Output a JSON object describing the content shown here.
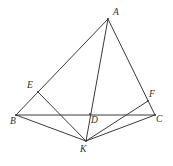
{
  "figure": {
    "type": "geometry-diagram",
    "canvas": {
      "width": 173,
      "height": 166,
      "background": "#ffffff"
    },
    "stroke_color": "#3a3a3a",
    "stroke_width": 1,
    "label_color": "#2e2e2e",
    "points": [
      {
        "id": "A",
        "label": "A",
        "x": 108,
        "y": 19,
        "label_x": 113,
        "label_y": 8,
        "on": "apex of triangle"
      },
      {
        "id": "E",
        "label": "E",
        "x": 38,
        "y": 92,
        "label_x": 27,
        "label_y": 81,
        "on": "segment AB"
      },
      {
        "id": "B",
        "label": "B",
        "x": 16,
        "y": 115,
        "label_x": 10,
        "label_y": 117,
        "on": "left base vertex"
      },
      {
        "id": "D",
        "label": "D",
        "x": 90,
        "y": 114,
        "label_x": 91,
        "label_y": 116,
        "on": "segment BC"
      },
      {
        "id": "K",
        "label": "K",
        "x": 86,
        "y": 141,
        "label_x": 80,
        "label_y": 145,
        "on": "below base BC"
      },
      {
        "id": "F",
        "label": "F",
        "x": 148,
        "y": 101,
        "label_x": 149,
        "label_y": 90,
        "on": "segment AC"
      },
      {
        "id": "C",
        "label": "C",
        "x": 155,
        "y": 115,
        "label_x": 156,
        "label_y": 115,
        "on": "right base vertex"
      }
    ],
    "segments": [
      {
        "name": "AB",
        "from": "A",
        "to": "B",
        "x1": 108,
        "y1": 19,
        "x2": 16,
        "y2": 115
      },
      {
        "name": "AC",
        "from": "A",
        "to": "C",
        "x1": 108,
        "y1": 19,
        "x2": 155,
        "y2": 115
      },
      {
        "name": "BC",
        "from": "B",
        "to": "C",
        "x1": 16,
        "y1": 115,
        "x2": 155,
        "y2": 115
      },
      {
        "name": "AK",
        "from": "A",
        "to": "K",
        "x1": 108,
        "y1": 19,
        "x2": 86,
        "y2": 141
      },
      {
        "name": "BK",
        "from": "B",
        "to": "K",
        "x1": 16,
        "y1": 115,
        "x2": 86,
        "y2": 141
      },
      {
        "name": "EK",
        "from": "E",
        "to": "K",
        "x1": 38,
        "y1": 92,
        "x2": 86,
        "y2": 141
      },
      {
        "name": "FK",
        "from": "F",
        "to": "K",
        "x1": 148,
        "y1": 101,
        "x2": 86,
        "y2": 141
      },
      {
        "name": "CK",
        "from": "C",
        "to": "K",
        "x1": 155,
        "y1": 115,
        "x2": 86,
        "y2": 141
      }
    ]
  }
}
